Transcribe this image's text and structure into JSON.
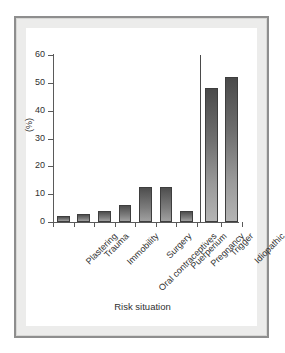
{
  "chart_data": {
    "type": "bar",
    "title": "",
    "xlabel": "Risk situation",
    "ylabel": "(%)",
    "categories": [
      "Plastering",
      "Trauma",
      "Immobility",
      "Oral contraceptives",
      "Surgery",
      "Puerperium",
      "Pregnancy",
      "Trigger",
      "Idiopathic"
    ],
    "values": [
      2,
      3,
      4,
      6,
      12.5,
      12.5,
      4,
      48,
      52
    ],
    "ylim": [
      0,
      60
    ],
    "yticks": [
      0,
      10,
      20,
      30,
      40,
      50,
      60
    ],
    "ytick_labels": [
      "0",
      "10",
      "20",
      "30",
      "40",
      "50",
      "60"
    ],
    "grid": false,
    "legend": null,
    "annotations": [
      {
        "name": "group-divider",
        "description": "vertical separator line before the Trigger bar, rising to the top of the y-axis"
      }
    ],
    "series": [
      {
        "name": "Percentage of patients",
        "values": [
          2,
          3,
          4,
          6,
          12.5,
          12.5,
          4,
          48,
          52
        ]
      }
    ]
  },
  "figure": {
    "frame_color": "#8e8e8e",
    "plot_background": "#ffffff",
    "bar_color_top": "#4a4a4a",
    "bar_color_bottom": "#b4b4b4",
    "axis_color": "#5a5a5a"
  }
}
